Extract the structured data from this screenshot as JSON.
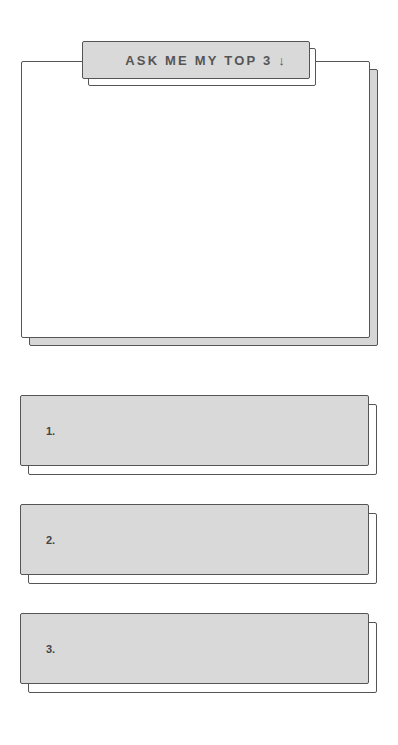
{
  "header": {
    "button_label": "ASK ME MY TOP 3",
    "button_icon": "arrow-down-icon",
    "button_icon_glyph": "↓"
  },
  "main_box": {
    "content": ""
  },
  "items": [
    {
      "number": "1.",
      "text": ""
    },
    {
      "number": "2.",
      "text": ""
    },
    {
      "number": "3.",
      "text": ""
    }
  ],
  "colors": {
    "card_fill": "#d9d9d9",
    "border": "#555555",
    "background": "#ffffff"
  }
}
